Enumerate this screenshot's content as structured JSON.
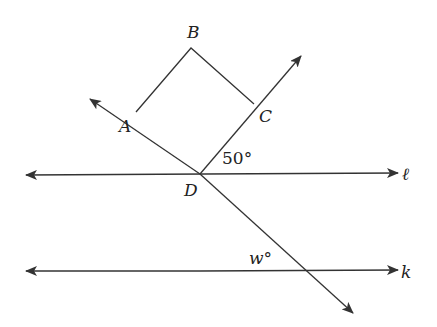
{
  "diagram": {
    "stroke_color": "#333333",
    "points": {
      "A": "A",
      "B": "B",
      "C": "C",
      "D": "D"
    },
    "lines": {
      "l": "ℓ",
      "k": "k"
    },
    "angles": {
      "given": "50°",
      "unknown": "w°"
    }
  }
}
